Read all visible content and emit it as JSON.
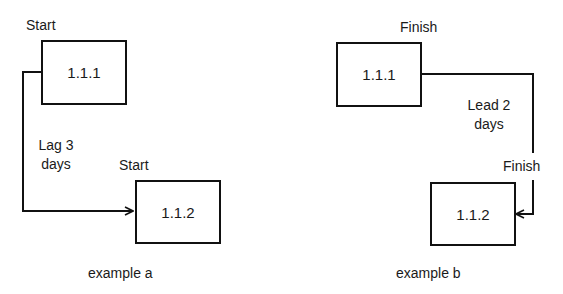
{
  "example_a": {
    "caption": "example a",
    "predecessor": {
      "id": "1.1.1",
      "label": "Start"
    },
    "successor": {
      "id": "1.1.2",
      "label": "Start"
    },
    "relation": {
      "line1": "Lag 3",
      "line2": "days"
    }
  },
  "example_b": {
    "caption": "example b",
    "predecessor": {
      "id": "1.1.1",
      "label": "Finish"
    },
    "successor": {
      "id": "1.1.2",
      "label": "Finish"
    },
    "relation": {
      "line1": "Lead 2",
      "line2": "days"
    }
  },
  "colors": {
    "line": "#111111",
    "background": "#ffffff"
  }
}
